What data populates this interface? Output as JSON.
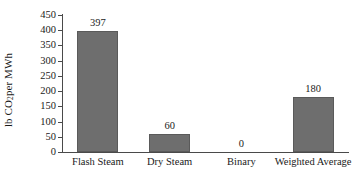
{
  "chart_data": {
    "type": "bar",
    "title": "",
    "xlabel": "",
    "ylabel_prefix": "lb CO",
    "ylabel_sub": "2",
    "ylabel_suffix": " per MWh",
    "ylabel_plain": "lb CO2 per MWh",
    "categories": [
      "Flash Steam",
      "Dry Steam",
      "Binary",
      "Weighted Average"
    ],
    "values": [
      397,
      60,
      0,
      180
    ],
    "value_labels": [
      "397",
      "60",
      "0",
      "180"
    ],
    "ylim": [
      0,
      450
    ],
    "yticks": [
      0,
      50,
      100,
      150,
      200,
      250,
      300,
      350,
      400,
      450
    ],
    "ytick_labels": [
      "0",
      "50",
      "100",
      "150",
      "200",
      "250",
      "300",
      "350",
      "400",
      "450"
    ],
    "grid": false,
    "legend": "none",
    "bar_color": "#6e6e6e",
    "bar_edge_color": "#5a5a5a",
    "axis_color": "#4a4a4a",
    "text_color": "#1a1a1a",
    "background": "#ffffff"
  }
}
